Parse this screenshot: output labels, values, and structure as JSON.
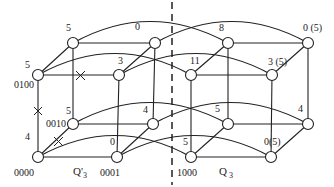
{
  "diagram": {
    "divider": "dashed-vertical",
    "subcubes": [
      {
        "label": "Q'",
        "subscript": "3"
      },
      {
        "label": "Q",
        "subscript": "3"
      }
    ],
    "node_addresses": {
      "n0000": "0000",
      "n0001": "0001",
      "n0010": "0010",
      "n0100": "0100",
      "n1000": "1000"
    },
    "weights": {
      "w_q3p_top_back_left": "5",
      "w_q3p_top_back_right": "0",
      "w_q3p_top_front_left": "5",
      "w_q3p_top_front_right": "3",
      "w_q3p_bot_back_left": "5",
      "w_q3p_bot_back_right": "4",
      "w_q3p_bot_front_left": "4",
      "w_q3p_bot_front_right": "0",
      "w_q3_top_back_left": "8",
      "w_q3_top_back_right": "0 (5)",
      "w_q3_top_front_left": "11",
      "w_q3_top_front_right": "3 (5)",
      "w_q3_bot_back_left": "5",
      "w_q3_bot_back_right": "4",
      "w_q3_bot_front_left": "5",
      "w_q3_bot_front_right": "0(5)"
    },
    "faulty_link_marker": "x-mark"
  }
}
